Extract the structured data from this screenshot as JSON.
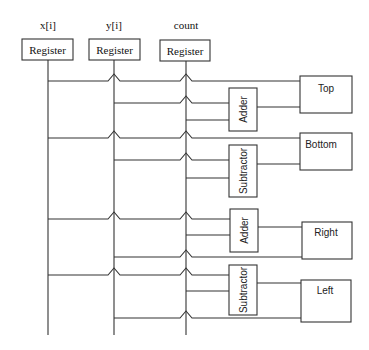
{
  "diagram": {
    "inputs": [
      {
        "label": "x[i]",
        "box": "Register"
      },
      {
        "label": "y[i]",
        "box": "Register"
      },
      {
        "label": "count",
        "box": "Register"
      }
    ],
    "operators": [
      {
        "label": "Adder"
      },
      {
        "label": "Subtractor"
      },
      {
        "label": "Adder"
      },
      {
        "label": "Subtractor"
      }
    ],
    "outputs": [
      {
        "label": "Top"
      },
      {
        "label": "Bottom"
      },
      {
        "label": "Right"
      },
      {
        "label": "Left"
      }
    ],
    "colors": {
      "line": "#333333",
      "background": "#ffffff"
    }
  }
}
